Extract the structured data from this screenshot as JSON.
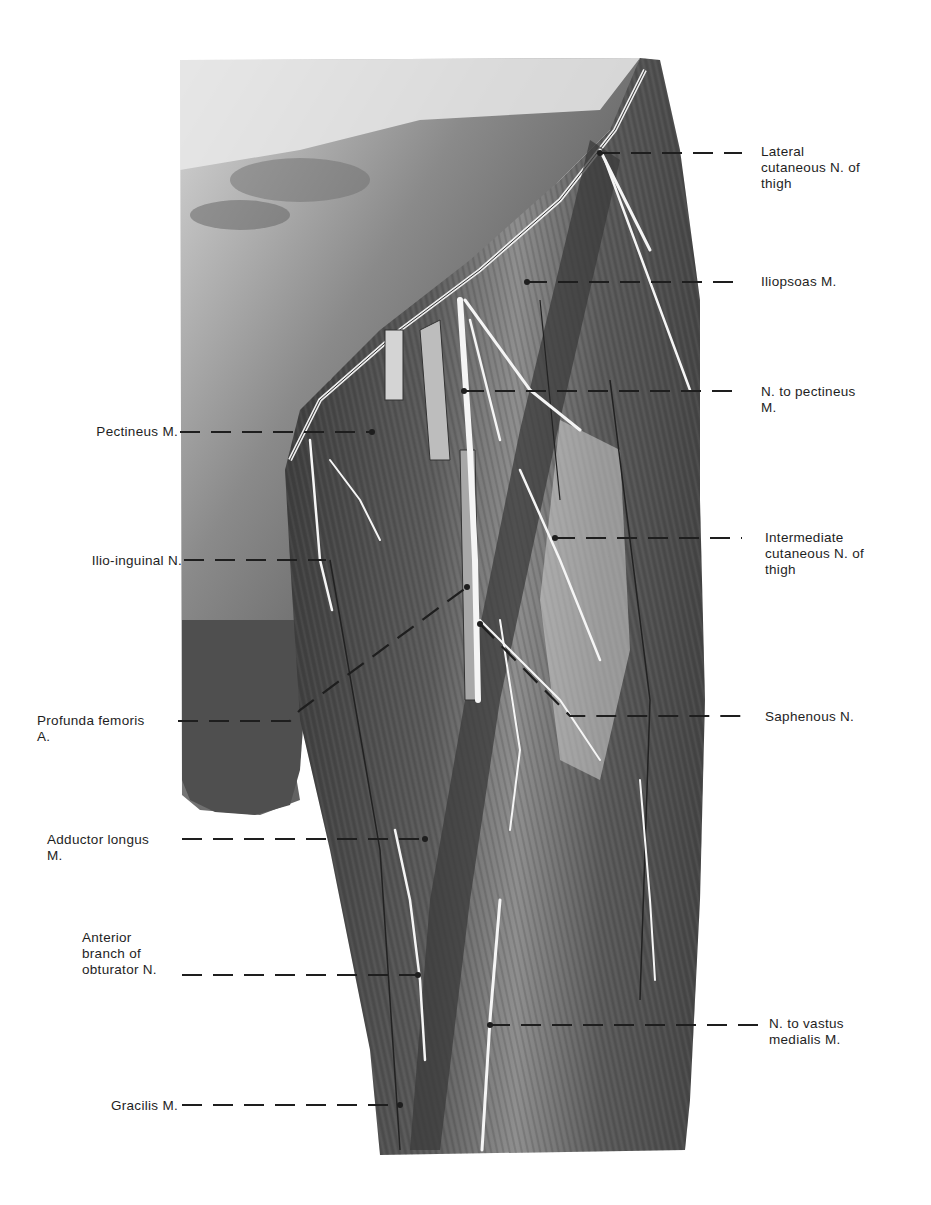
{
  "figure": {
    "colors": {
      "background": "#ffffff",
      "muscle_dark": "#3a3a3a",
      "muscle_mid": "#6b6b6b",
      "nerve": "#f4f4f4",
      "leader": "#1e1e1e"
    }
  },
  "labels_right": [
    {
      "id": "lateral-cutaneous-n-of-thigh",
      "lines": [
        "Lateral",
        "cutaneous N. of",
        "thigh"
      ],
      "text_x": 761,
      "text_y": 144,
      "leader_y": 153,
      "leader_from_x": 600,
      "leader_to_x": 742
    },
    {
      "id": "iliopsoas-m",
      "lines": [
        "Iliopsoas M."
      ],
      "text_x": 761,
      "text_y": 274,
      "leader_y": 282,
      "leader_from_x": 527,
      "leader_to_x": 742
    },
    {
      "id": "n-to-pectineus-m",
      "lines": [
        "N. to pectineus",
        "M."
      ],
      "text_x": 761,
      "text_y": 384,
      "leader_y": 391,
      "leader_from_x": 464,
      "leader_to_x": 742
    },
    {
      "id": "intermediate-cutaneous-n-of-thigh",
      "lines": [
        "Intermediate",
        "cutaneous N. of",
        "thigh"
      ],
      "text_x": 765,
      "text_y": 530,
      "leader_y": 538,
      "leader_from_x": 555,
      "leader_to_x": 742
    },
    {
      "id": "saphenous-n",
      "lines": [
        "Saphenous N."
      ],
      "text_x": 765,
      "text_y": 709,
      "leader_y": 716,
      "leader_from_x": 570,
      "leader_to_x": 745
    },
    {
      "id": "n-to-vastus-medialis-m",
      "lines": [
        "N. to vastus",
        "medialis M."
      ],
      "text_x": 769,
      "text_y": 1016,
      "leader_y": 1025,
      "leader_from_x": 490,
      "leader_to_x": 760
    }
  ],
  "labels_left": [
    {
      "id": "pectineus-m",
      "lines": [
        "Pectineus M."
      ],
      "text_right_x": 178,
      "text_y": 424,
      "leader_y": 432,
      "leader_from_x": 180,
      "leader_to_x": 372
    },
    {
      "id": "ilio-inguinal-n",
      "lines": [
        "Ilio-inguinal N."
      ],
      "text_right_x": 182,
      "text_y": 553,
      "leader_y": 560,
      "leader_from_x": 184,
      "leader_to_x": 326
    },
    {
      "id": "profunda-femoris-a",
      "lines": [
        "Profunda femoris",
        "A."
      ],
      "text_right_x": 175,
      "text_y": 713,
      "leader_y": 721,
      "leader_from_x": 178,
      "leader_to_x": 300
    },
    {
      "id": "adductor-longus-m",
      "lines": [
        "Adductor longus",
        "M."
      ],
      "text_right_x": 179,
      "text_y": 832,
      "leader_y": 839,
      "leader_from_x": 182,
      "leader_to_x": 425
    },
    {
      "id": "anterior-branch-of-obturator-n",
      "lines": [
        "Anterior",
        "branch of",
        "obturator N."
      ],
      "text_right_x": 180,
      "text_y": 930,
      "leader_y": 975,
      "leader_from_x": 182,
      "leader_to_x": 418
    },
    {
      "id": "gracilis-m",
      "lines": [
        "Gracilis M."
      ],
      "text_right_x": 177,
      "text_y": 1098,
      "leader_y": 1105,
      "leader_from_x": 182,
      "leader_to_x": 400
    }
  ]
}
